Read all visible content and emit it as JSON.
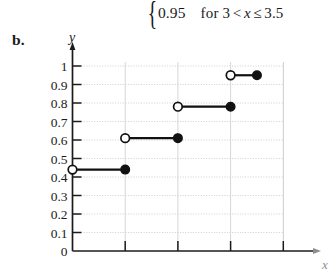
{
  "formula": {
    "brace": "{",
    "value": "0.95",
    "condition_text": "for 3",
    "lt": "<",
    "var": "x",
    "le": "≤",
    "upper": "3.5"
  },
  "part_label": "b.",
  "axes": {
    "y_label": "y",
    "x_label": "x"
  },
  "chart_data": {
    "type": "line",
    "title": "",
    "xlabel": "x",
    "ylabel": "y",
    "grid": true,
    "legend": "none",
    "xlim": [
      0,
      4.5
    ],
    "ylim": [
      0,
      1.0
    ],
    "y_ticks": [
      0,
      0.1,
      0.2,
      0.3,
      0.4,
      0.5,
      0.6,
      0.7,
      0.8,
      0.9,
      1
    ],
    "y_tick_labels": [
      "0",
      "0.1",
      "0.2",
      "0.3",
      "0.4",
      "0.5",
      "0.6",
      "0.7",
      "0.8",
      "0.9",
      "1"
    ],
    "x_ticks": [
      1,
      2,
      3,
      4
    ],
    "x_tick_labels": [
      "",
      "",
      "",
      ""
    ],
    "steps": [
      {
        "y": 0.44,
        "x_start": 0,
        "x_end": 1,
        "left_endpoint": "open",
        "right_endpoint": "closed"
      },
      {
        "y": 0.61,
        "x_start": 1,
        "x_end": 2,
        "left_endpoint": "open",
        "right_endpoint": "closed"
      },
      {
        "y": 0.78,
        "x_start": 2,
        "x_end": 3,
        "left_endpoint": "open",
        "right_endpoint": "closed"
      },
      {
        "y": 0.95,
        "x_start": 3,
        "x_end": 3.5,
        "left_endpoint": "open",
        "right_endpoint": "closed"
      }
    ]
  }
}
